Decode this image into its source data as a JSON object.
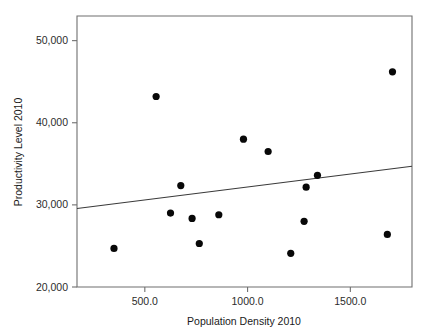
{
  "chart_data": {
    "type": "scatter",
    "title": "",
    "xlabel": "Population Density 2010",
    "ylabel": "Productivity Level 2010",
    "xlim": [
      170,
      1800
    ],
    "ylim": [
      20000,
      53000
    ],
    "grid": false,
    "legend": null,
    "xticks": [
      500,
      1000,
      1500
    ],
    "xtick_labels": [
      "500.0",
      "1000.0",
      "1500.0"
    ],
    "yticks": [
      20000,
      30000,
      40000,
      50000
    ],
    "ytick_labels": [
      "20,000",
      "30,000",
      "40,000",
      "50,000"
    ],
    "marker": "filled-circle",
    "marker_color": "#080808",
    "points": [
      {
        "x": 350,
        "y": 24700
      },
      {
        "x": 555,
        "y": 43200
      },
      {
        "x": 625,
        "y": 29000
      },
      {
        "x": 675,
        "y": 32350
      },
      {
        "x": 730,
        "y": 28350
      },
      {
        "x": 765,
        "y": 25300
      },
      {
        "x": 860,
        "y": 28800
      },
      {
        "x": 980,
        "y": 38000
      },
      {
        "x": 1100,
        "y": 36500
      },
      {
        "x": 1210,
        "y": 24100
      },
      {
        "x": 1275,
        "y": 28000
      },
      {
        "x": 1285,
        "y": 32150
      },
      {
        "x": 1340,
        "y": 33600
      },
      {
        "x": 1680,
        "y": 26400
      },
      {
        "x": 1705,
        "y": 46200
      }
    ],
    "fit_line": {
      "type": "linear-regression",
      "x_start": 170,
      "y_start": 29550,
      "x_end": 1800,
      "y_end": 34700,
      "color": "#3a3a3a"
    }
  },
  "axes": {
    "x_axis_label": "Population Density 2010",
    "y_axis_label": "Productivity Level 2010"
  }
}
